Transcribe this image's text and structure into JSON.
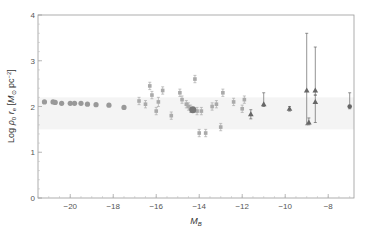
{
  "chart_data": {
    "type": "scatter",
    "title": "",
    "xlabel": "M_B",
    "ylabel": "Log ρ0 re [M⊙ pc^-2]",
    "xlim": [
      -21.5,
      -6.8
    ],
    "ylim": [
      0,
      4
    ],
    "xticks": [
      -20,
      -18,
      -16,
      -14,
      -12,
      -10,
      -8
    ],
    "yticks": [
      0,
      1,
      2,
      3,
      4
    ],
    "grid": false,
    "reference_band": {
      "y": [
        1.5,
        2.2
      ],
      "color": "#f4f4f4"
    },
    "series": [
      {
        "name": "large galaxies",
        "marker": "circle",
        "color": "#999999",
        "points": [
          {
            "x": -21.2,
            "y": 2.1
          },
          {
            "x": -20.8,
            "y": 2.1
          },
          {
            "x": -20.7,
            "y": 2.09
          },
          {
            "x": -20.4,
            "y": 2.07
          },
          {
            "x": -20.0,
            "y": 2.07
          },
          {
            "x": -19.8,
            "y": 2.07
          },
          {
            "x": -19.5,
            "y": 2.07
          },
          {
            "x": -19.2,
            "y": 2.05
          },
          {
            "x": -18.8,
            "y": 2.04
          },
          {
            "x": -18.2,
            "y": 2.03
          },
          {
            "x": -17.5,
            "y": 1.98
          }
        ]
      },
      {
        "name": "dwarf galaxies",
        "marker": "square-err",
        "color": "#aaaaaa",
        "points": [
          {
            "x": -16.8,
            "y": 2.12,
            "err": 0.08
          },
          {
            "x": -16.5,
            "y": 2.05,
            "err": 0.08
          },
          {
            "x": -16.3,
            "y": 2.45,
            "err": 0.08
          },
          {
            "x": -16.2,
            "y": 2.25,
            "err": 0.08
          },
          {
            "x": -16.0,
            "y": 1.9,
            "err": 0.08
          },
          {
            "x": -15.9,
            "y": 2.1,
            "err": 0.1
          },
          {
            "x": -15.7,
            "y": 2.35,
            "err": 0.08
          },
          {
            "x": -15.3,
            "y": 1.8,
            "err": 0.08
          },
          {
            "x": -14.9,
            "y": 2.3,
            "err": 0.08
          },
          {
            "x": -14.8,
            "y": 2.15,
            "err": 0.08
          },
          {
            "x": -14.6,
            "y": 2.05,
            "err": 0.08
          },
          {
            "x": -14.5,
            "y": 2.0,
            "err": 0.08
          },
          {
            "x": -14.4,
            "y": 1.95,
            "err": 0.08
          },
          {
            "x": -14.2,
            "y": 2.6,
            "err": 0.08
          },
          {
            "x": -14.1,
            "y": 1.9,
            "err": 0.08
          },
          {
            "x": -13.9,
            "y": 1.9,
            "err": 0.08
          },
          {
            "x": -14.0,
            "y": 1.42,
            "err": 0.08
          },
          {
            "x": -13.7,
            "y": 1.42,
            "err": 0.08
          },
          {
            "x": -13.4,
            "y": 2.0,
            "err": 0.08
          },
          {
            "x": -13.2,
            "y": 2.05,
            "err": 0.08
          },
          {
            "x": -13.0,
            "y": 1.55,
            "err": 0.08
          },
          {
            "x": -12.9,
            "y": 2.3,
            "err": 0.08
          },
          {
            "x": -12.4,
            "y": 2.1,
            "err": 0.08
          },
          {
            "x": -12.0,
            "y": 1.95,
            "err": 0.08
          },
          {
            "x": -11.9,
            "y": 2.15,
            "err": 0.08
          }
        ]
      },
      {
        "name": "big dot",
        "marker": "circle-dark",
        "color": "#777777",
        "points": [
          {
            "x": -14.3,
            "y": 1.93
          }
        ]
      },
      {
        "name": "ultra-faint",
        "marker": "triangle",
        "color": "#666666",
        "points": [
          {
            "x": -11.6,
            "y": 1.83,
            "err_lo": 0.1,
            "err_hi": 0.1
          },
          {
            "x": -11.0,
            "y": 2.05,
            "err_lo": 0.05,
            "err_hi": 0.25
          },
          {
            "x": -9.8,
            "y": 1.95,
            "err_lo": 0.05,
            "err_hi": 0.05
          },
          {
            "x": -9.0,
            "y": 2.35,
            "err_lo": 0.75,
            "err_hi": 1.25
          },
          {
            "x": -8.9,
            "y": 1.65,
            "err_lo": 0.05,
            "err_hi": 0.1
          },
          {
            "x": -8.6,
            "y": 2.35,
            "err_lo": 0.1,
            "err_hi": 0.95
          },
          {
            "x": -8.6,
            "y": 2.1,
            "err_lo": 0.45,
            "err_hi": 0.15
          }
        ]
      },
      {
        "name": "last point",
        "marker": "circle-err",
        "color": "#666666",
        "points": [
          {
            "x": -7.0,
            "y": 2.0,
            "err_lo": 0.05,
            "err_hi": 0.3
          }
        ]
      }
    ]
  }
}
